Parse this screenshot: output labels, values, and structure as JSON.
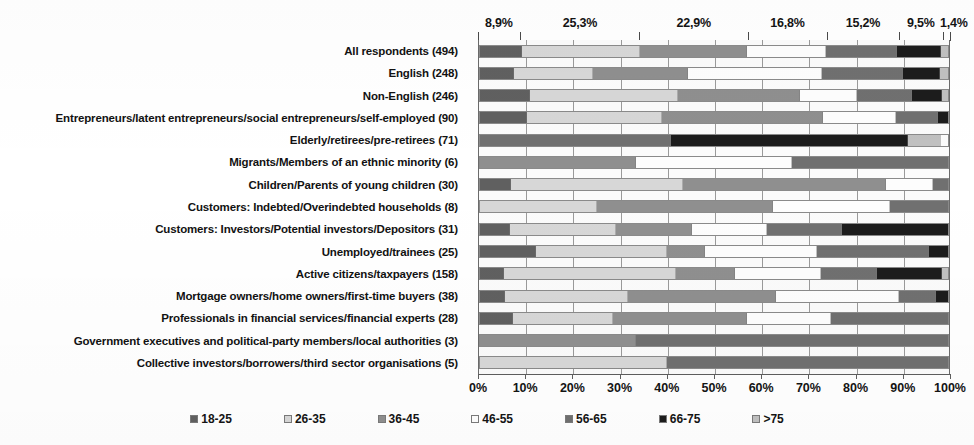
{
  "chart_data": {
    "type": "bar",
    "subtype": "stacked-horizontal-100pct",
    "title": "",
    "xlabel": "",
    "ylabel": "",
    "xlim": [
      0,
      100
    ],
    "grid": true,
    "legend_position": "bottom",
    "xticks": [
      "0%",
      "10%",
      "20%",
      "30%",
      "40%",
      "50%",
      "60%",
      "70%",
      "80%",
      "90%",
      "100%"
    ],
    "xtick_values": [
      0,
      10,
      20,
      30,
      40,
      50,
      60,
      70,
      80,
      90,
      100
    ],
    "series_names": [
      "18-25",
      "26-35",
      "36-45",
      "46-55",
      "56-65",
      "66-75",
      ">75"
    ],
    "series_colors": [
      "#606060",
      "#d7d7d7",
      "#8f8f8f",
      "#fdfdfd",
      "#707070",
      "#1c1c1c",
      "#c0c0c0"
    ],
    "top_value_labels": [
      "8,9%",
      "25,3%",
      "22,9%",
      "16,8%",
      "15,2%",
      "9,5%",
      "1,4%"
    ],
    "categories": [
      "All respondents (494)",
      "English (248)",
      "Non-English (246)",
      "Entrepreneurs/latent entrepreneurs/social entrepreneurs/self-employed (90)",
      "Elderly/retirees/pre-retirees (71)",
      "Migrants/Members of an ethnic minority (6)",
      "Children/Parents of young children (30)",
      "Customers: Indebted/Overindebted households (8)",
      "Customers: Investors/Potential investors/Depositors (31)",
      "Unemployed/trainees (25)",
      "Active citizens/taxpayers (158)",
      "Mortgage owners/home owners/first-time buyers (38)",
      "Professionals in financial services/financial experts (28)",
      "Government executives and political-party members/local authorities (3)",
      "Collective investors/borrowers/third sector organisations (5)"
    ],
    "rows": [
      {
        "label": "All respondents (494)",
        "values": [
          8.9,
          25.3,
          22.9,
          16.8,
          15.2,
          9.5,
          1.4
        ]
      },
      {
        "label": "English (248)",
        "values": [
          7.3,
          16.9,
          20.2,
          28.6,
          17.3,
          8.1,
          1.6
        ]
      },
      {
        "label": "Non-English (246)",
        "values": [
          10.6,
          31.7,
          26.0,
          12.2,
          11.8,
          6.5,
          1.2
        ]
      },
      {
        "label": "Entrepreneurs/latent entrepreneurs/social entrepreneurs/self-employed (90)",
        "values": [
          10.0,
          28.9,
          34.4,
          15.6,
          8.9,
          2.2,
          0.0
        ]
      },
      {
        "label": "Elderly/retirees/pre-retirees (71)",
        "values": [
          0.0,
          0.0,
          0.0,
          0.0,
          40.8,
          50.7,
          7.0
        ]
      },
      {
        "label": "Migrants/Members of an ethnic minority (6)",
        "values": [
          0.0,
          0.0,
          33.3,
          33.3,
          33.3,
          0.0,
          0.0
        ]
      },
      {
        "label": "Children/Parents of young children (30)",
        "values": [
          6.7,
          36.7,
          43.3,
          10.0,
          3.3,
          0.0,
          0.0
        ]
      },
      {
        "label": "Customers: Indebted/Overindebted households (8)",
        "values": [
          0.0,
          25.0,
          37.5,
          25.0,
          12.5,
          0.0,
          0.0
        ]
      },
      {
        "label": "Customers: Investors/Potential investors/Depositors (31)",
        "values": [
          6.5,
          22.6,
          16.1,
          16.1,
          16.1,
          22.6,
          0.0
        ]
      },
      {
        "label": "Unemployed/trainees (25)",
        "values": [
          12.0,
          28.0,
          8.0,
          24.0,
          24.0,
          4.0,
          0.0
        ]
      },
      {
        "label": "Active citizens/taxpayers (158)",
        "values": [
          5.1,
          36.7,
          12.7,
          18.4,
          12.0,
          13.9,
          1.2
        ]
      },
      {
        "label": "Mortgage owners/home owners/first-time buyers (38)",
        "values": [
          5.3,
          26.3,
          31.6,
          26.3,
          7.9,
          2.6,
          0.0
        ]
      },
      {
        "label": "Professionals in financial services/financial experts (28)",
        "values": [
          7.1,
          21.4,
          28.6,
          17.9,
          25.0,
          0.0,
          0.0
        ]
      },
      {
        "label": "Government executives and political-party members/local authorities (3)",
        "values": [
          0.0,
          0.0,
          33.3,
          0.0,
          66.7,
          0.0,
          0.0
        ]
      },
      {
        "label": "Collective investors/borrowers/third sector organisations (5)",
        "values": [
          0.0,
          40.0,
          0.0,
          0.0,
          60.0,
          0.0,
          0.0
        ]
      }
    ]
  },
  "legend": {
    "items": [
      {
        "label": "18-25",
        "color": "#606060"
      },
      {
        "label": "26-35",
        "color": "#d7d7d7"
      },
      {
        "label": "36-45",
        "color": "#8f8f8f"
      },
      {
        "label": "46-55",
        "color": "#fdfdfd"
      },
      {
        "label": "56-65",
        "color": "#707070"
      },
      {
        "label": "66-75",
        "color": "#1c1c1c"
      },
      {
        "label": ">75",
        "color": "#c0c0c0"
      }
    ]
  }
}
